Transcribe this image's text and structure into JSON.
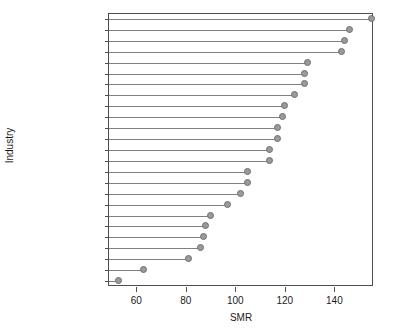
{
  "chart_data": {
    "type": "scatter",
    "title": "",
    "xlabel": "SMR",
    "ylabel": "Industry",
    "xlim": [
      49,
      156
    ],
    "xticks": [
      60,
      80,
      100,
      120,
      140
    ],
    "xticklabels": [
      "60",
      "80",
      "100",
      "120",
      "140"
    ],
    "grid": false,
    "legend": null,
    "orientation": "horizontal-dotplot",
    "categories": [
      "Furnace",
      "Labouring",
      "Construction",
      "Painting",
      "Tobacco",
      "Communications",
      "Glass",
      "Chemical",
      "Service",
      "Engineering",
      "Mining",
      "Warehouse",
      "Crane driving",
      "Woodwork",
      "Clothing",
      "Leather",
      "Electrical",
      "Other",
      "Textile",
      "Printing",
      "Sales",
      "Farming",
      "Clerical",
      "Management",
      "Professional"
    ],
    "values": [
      155,
      146,
      144,
      143,
      129,
      128,
      128,
      124,
      120,
      119,
      117,
      117,
      114,
      114,
      105,
      105,
      102,
      97,
      90,
      88,
      87,
      86,
      81,
      63,
      53
    ]
  },
  "style": {
    "point_fill": "#9a9a9a",
    "point_stroke": "#6e6e6e",
    "line_color": "#808080",
    "axis_color": "#4d4d4d",
    "text_color": "#1a1a1a",
    "background": "#ffffff"
  }
}
